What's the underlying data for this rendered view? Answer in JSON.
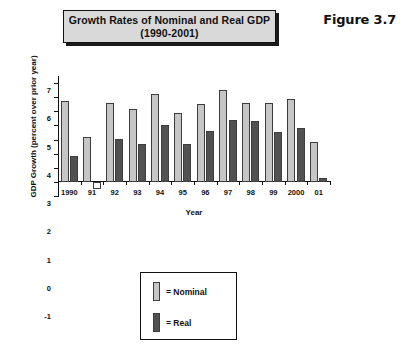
{
  "figure": {
    "label": "Figure 3.7",
    "title": "Growth Rates of Nominal and Real GDP (1990-2001)"
  },
  "legend": {
    "nominal_label": "= Nominal",
    "real_label": "= Real",
    "nominal_color": "#c6c6c6",
    "real_color": "#515151"
  },
  "chart_data": {
    "type": "bar",
    "title": "Growth Rates of Nominal and Real GDP (1990-2001)",
    "xlabel": "Year",
    "ylabel": "GDP Growth (percent over prior year)",
    "categories": [
      "1990",
      "91",
      "92",
      "93",
      "94",
      "95",
      "96",
      "97",
      "98",
      "99",
      "2000",
      "01"
    ],
    "series": [
      {
        "name": "Nominal",
        "color": "#c6c6c6",
        "values": [
          5.7,
          3.2,
          5.6,
          5.15,
          6.2,
          4.85,
          5.55,
          6.5,
          5.6,
          5.6,
          5.9,
          2.8
        ]
      },
      {
        "name": "Real",
        "color": "#515151",
        "values": [
          1.85,
          -0.5,
          3.05,
          2.7,
          4.0,
          2.65,
          3.6,
          4.4,
          4.3,
          3.55,
          3.85,
          0.25
        ]
      }
    ],
    "ylim": [
      -1,
      7.5
    ],
    "yticks": [
      -1,
      0,
      1,
      2,
      3,
      4,
      5,
      6,
      7
    ],
    "ytick_labels": [
      "-1",
      "0",
      "1",
      "2",
      "3",
      "4",
      "5",
      "6",
      "7"
    ],
    "grid": false,
    "legend_position": "below-center"
  }
}
